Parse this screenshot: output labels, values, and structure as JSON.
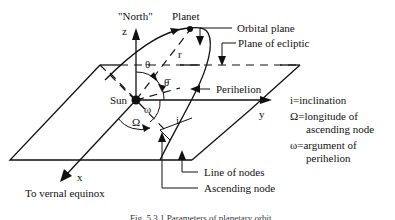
{
  "diagram": {
    "labels": {
      "north": "\"North\"",
      "z_axis": "z",
      "planet": "Planet",
      "r": "r",
      "theta": "θ",
      "theta_bar": "θ̄",
      "sun": "Sun",
      "omega_small": "ω",
      "omega_big": "Ω",
      "inclination_i": "i",
      "y_axis": "y",
      "x_axis": "x",
      "to_vernal_equinox": "To vernal equinox",
      "orbital_plane": "Orbital plane",
      "plane_of_ecliptic": "Plane of ecliptic",
      "perihelion": "Perihelion",
      "line_of_nodes": "Line of nodes",
      "ascending_node": "Ascending node"
    },
    "legend": [
      {
        "symbol": "i",
        "line1": "i=inclination",
        "line2": ""
      },
      {
        "symbol": "Ω",
        "line1": "Ω=longitude of",
        "line2": "ascending node"
      },
      {
        "symbol": "ω",
        "line1": "ω=argument of",
        "line2": "perihelion"
      }
    ],
    "caption": "Fig. 5.3.1 Parameters of planetary orbit",
    "colors": {
      "ink": "#111111",
      "background": "#ffffff"
    }
  }
}
